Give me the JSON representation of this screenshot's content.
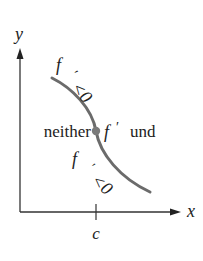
{
  "diagram": {
    "axes": {
      "x_label": "x",
      "y_label": "y",
      "tick_label": "c"
    },
    "curve": {
      "color": "#6b6b6b",
      "description": "decreasing curve, concave down above c then concave up below c (inflection at c)"
    },
    "point": {
      "color": "#7a7a7a"
    },
    "labels": {
      "left_of_point": "neither",
      "right_of_point_f": "f",
      "right_of_point_prime": "′",
      "right_of_point_text": "und",
      "upper_f": "f",
      "upper_prime": "′",
      "upper_ineq": "<0",
      "lower_f": "f",
      "lower_prime": "′",
      "lower_ineq": "<0"
    }
  }
}
